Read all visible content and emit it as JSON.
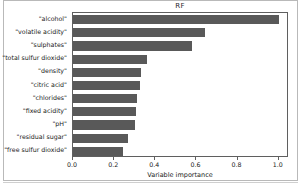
{
  "chart_data": {
    "type": "bar",
    "orientation": "horizontal",
    "title": "RF",
    "xlabel": "Variable importance",
    "ylabel": "",
    "xlim": [
      0.0,
      1.05
    ],
    "xticks": [
      "0.0",
      "0.2",
      "0.4",
      "0.6",
      "0.8",
      "1.0"
    ],
    "xtick_values": [
      0.0,
      0.2,
      0.4,
      0.6,
      0.8,
      1.0
    ],
    "grid": false,
    "legend": false,
    "bar_color": "#595959",
    "categories": [
      "\"alcohol\"",
      "\"volatile acidity\"",
      "\"sulphates\"",
      "\"total sulfur dioxide\"",
      "\"density\"",
      "\"citric acid\"",
      "\"chlorides\"",
      "\"fixed acidity\"",
      "\"pH\"",
      "\"residual sugar\"",
      "\"free sulfur dioxide\""
    ],
    "values": [
      1.0,
      0.64,
      0.578,
      0.36,
      0.331,
      0.327,
      0.313,
      0.308,
      0.299,
      0.265,
      0.242
    ]
  }
}
